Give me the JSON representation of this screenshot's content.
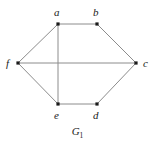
{
  "figure": {
    "caption_base": "G",
    "caption_subscript": "1",
    "caption_full": "G1",
    "background_color": "#ffffff",
    "edge_color": "#8c8c8c",
    "vertex_color": "#1a1a1a",
    "label_color": "#1a1a1a"
  },
  "graph": {
    "type": "undirected-graph",
    "vertex_count": 6,
    "edge_count": 8,
    "vertices": [
      {
        "id": "a",
        "label": "a",
        "x": 58,
        "y": 24,
        "label_x": 54,
        "label_y": 7
      },
      {
        "id": "b",
        "label": "b",
        "x": 97,
        "y": 24,
        "label_x": 93,
        "label_y": 7
      },
      {
        "id": "c",
        "label": "c",
        "x": 136,
        "y": 63,
        "label_x": 143,
        "label_y": 58
      },
      {
        "id": "d",
        "label": "d",
        "x": 97,
        "y": 104,
        "label_x": 93,
        "label_y": 110
      },
      {
        "id": "e",
        "label": "e",
        "x": 58,
        "y": 104,
        "label_x": 54,
        "label_y": 110
      },
      {
        "id": "f",
        "label": "f",
        "x": 18,
        "y": 63,
        "label_x": 6,
        "label_y": 58
      }
    ],
    "edges": [
      {
        "from": "a",
        "to": "b"
      },
      {
        "from": "b",
        "to": "c"
      },
      {
        "from": "c",
        "to": "d"
      },
      {
        "from": "d",
        "to": "e"
      },
      {
        "from": "e",
        "to": "f"
      },
      {
        "from": "f",
        "to": "a"
      },
      {
        "from": "a",
        "to": "e"
      },
      {
        "from": "f",
        "to": "c"
      }
    ]
  }
}
